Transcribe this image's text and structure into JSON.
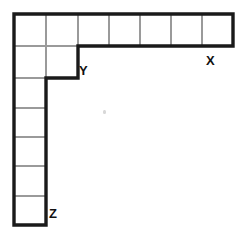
{
  "figure": {
    "background_color": "#ffffff",
    "outline_color": "#1a1a1a",
    "grid_line_color": "#9a9a9a",
    "cell_size_px": 31.8,
    "origin": {
      "x": 14,
      "y": 14
    },
    "structure": {
      "description": "A 2x2 square block at the top-left, a horizontal arm of 5 unit cells extending right along the top row, and a vertical arm of 5 unit cells extending down along the left column.",
      "block_rows": 2,
      "block_cols": 2,
      "horizontal_arm_cells": 5,
      "vertical_arm_cells": 5,
      "total_cells": 14
    },
    "labels": [
      {
        "id": "label-x",
        "text": "X",
        "x": 206,
        "y": 54,
        "describes": "right end of the horizontal arm"
      },
      {
        "id": "label-y",
        "text": "Y",
        "x": 79,
        "y": 64,
        "describes": "inner corner where the horizontal arm meets the block"
      },
      {
        "id": "label-z",
        "text": "Z",
        "x": 49,
        "y": 207,
        "describes": "bottom end of the vertical arm"
      }
    ],
    "cells": [
      {
        "name": "block-r0-c0",
        "x": 14,
        "y": 14,
        "w": 32,
        "h": 32
      },
      {
        "name": "block-r0-c1",
        "x": 46,
        "y": 14,
        "w": 32,
        "h": 32
      },
      {
        "name": "block-r1-c0",
        "x": 14,
        "y": 46,
        "w": 32,
        "h": 32
      },
      {
        "name": "block-r1-c1",
        "x": 46,
        "y": 46,
        "w": 32,
        "h": 32
      },
      {
        "name": "arm-right-1",
        "x": 78,
        "y": 14,
        "w": 31,
        "h": 32
      },
      {
        "name": "arm-right-2",
        "x": 109,
        "y": 14,
        "w": 31,
        "h": 32
      },
      {
        "name": "arm-right-3",
        "x": 140,
        "y": 14,
        "w": 31,
        "h": 32
      },
      {
        "name": "arm-right-4",
        "x": 171,
        "y": 14,
        "w": 31,
        "h": 32
      },
      {
        "name": "arm-right-5",
        "x": 202,
        "y": 14,
        "w": 31,
        "h": 32
      },
      {
        "name": "arm-down-1",
        "x": 14,
        "y": 78,
        "w": 32,
        "h": 30
      },
      {
        "name": "arm-down-2",
        "x": 14,
        "y": 108,
        "w": 32,
        "h": 29
      },
      {
        "name": "arm-down-3",
        "x": 14,
        "y": 137,
        "w": 32,
        "h": 29
      },
      {
        "name": "arm-down-4",
        "x": 14,
        "y": 166,
        "w": 32,
        "h": 30
      },
      {
        "name": "arm-down-5",
        "x": 14,
        "y": 196,
        "w": 32,
        "h": 29
      }
    ],
    "interior_lines": [
      {
        "name": "grid-v-46-top",
        "x1": 46,
        "y1": 14,
        "x2": 46,
        "y2": 78
      },
      {
        "name": "grid-v-78",
        "x1": 78,
        "y1": 14,
        "x2": 78,
        "y2": 46
      },
      {
        "name": "grid-v-109",
        "x1": 109,
        "y1": 14,
        "x2": 109,
        "y2": 46
      },
      {
        "name": "grid-v-140",
        "x1": 140,
        "y1": 14,
        "x2": 140,
        "y2": 46
      },
      {
        "name": "grid-v-171",
        "x1": 171,
        "y1": 14,
        "x2": 171,
        "y2": 46
      },
      {
        "name": "grid-v-202",
        "x1": 202,
        "y1": 14,
        "x2": 202,
        "y2": 46
      },
      {
        "name": "grid-h-46",
        "x1": 14,
        "y1": 46,
        "x2": 78,
        "y2": 46
      },
      {
        "name": "grid-h-78-arm",
        "x1": 14,
        "y1": 78,
        "x2": 46,
        "y2": 78
      },
      {
        "name": "grid-h-108",
        "x1": 14,
        "y1": 108,
        "x2": 46,
        "y2": 108
      },
      {
        "name": "grid-h-137",
        "x1": 14,
        "y1": 137,
        "x2": 46,
        "y2": 137
      },
      {
        "name": "grid-h-166",
        "x1": 14,
        "y1": 166,
        "x2": 46,
        "y2": 166
      },
      {
        "name": "grid-h-196",
        "x1": 14,
        "y1": 196,
        "x2": 46,
        "y2": 196
      }
    ],
    "outline_path": "M 14 14 L 233 14 L 233 46 L 78 46 L 78 78 L 46 78 L 46 225 L 14 225 Z",
    "artifact": {
      "name": "scan-speck",
      "x": 103,
      "y": 110
    }
  }
}
